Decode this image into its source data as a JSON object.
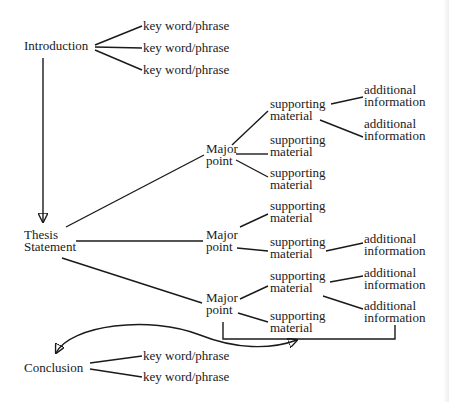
{
  "diagram": {
    "type": "essay-structure-tree",
    "nodes": {
      "introduction": {
        "label": "Introduction",
        "x": 24,
        "y": 40
      },
      "intro_kw": [
        {
          "label": "key word/phrase",
          "x": 143,
          "y": 20
        },
        {
          "label": "key word/phrase",
          "x": 143,
          "y": 42
        },
        {
          "label": "key word/phrase",
          "x": 143,
          "y": 64
        }
      ],
      "thesis": {
        "lines": [
          "Thesis",
          "Statement"
        ],
        "x": 24,
        "y": 229
      },
      "major_points": [
        {
          "lines": [
            "Major",
            "point"
          ],
          "x": 206,
          "y": 148,
          "supporting": [
            {
              "lines": [
                "supporting",
                "material"
              ],
              "x": 270,
              "y": 95,
              "additional": [
                {
                  "lines": [
                    "additional",
                    "information"
                  ],
                  "x": 364,
                  "y": 84
                },
                {
                  "lines": [
                    "additional",
                    "information"
                  ],
                  "x": 364,
                  "y": 119
                }
              ]
            },
            {
              "lines": [
                "supporting",
                "material"
              ],
              "x": 270,
              "y": 133,
              "additional": []
            },
            {
              "lines": [
                "supporting",
                "material"
              ],
              "x": 270,
              "y": 167,
              "additional": []
            }
          ]
        },
        {
          "lines": [
            "Major",
            "point"
          ],
          "x": 206,
          "y": 229,
          "supporting": [
            {
              "lines": [
                "supporting",
                "material"
              ],
              "x": 270,
              "y": 200,
              "additional": []
            },
            {
              "lines": [
                "supporting",
                "material"
              ],
              "x": 270,
              "y": 237,
              "additional": [
                {
                  "lines": [
                    "additional",
                    "information"
                  ],
                  "x": 364,
                  "y": 233
                }
              ]
            }
          ]
        },
        {
          "lines": [
            "Major",
            "point"
          ],
          "x": 206,
          "y": 296,
          "supporting": [
            {
              "lines": [
                "supporting",
                "material"
              ],
              "x": 270,
              "y": 274,
              "additional": [
                {
                  "lines": [
                    "additional",
                    "information"
                  ],
                  "x": 364,
                  "y": 267
                },
                {
                  "lines": [
                    "additional",
                    "information"
                  ],
                  "x": 364,
                  "y": 300
                }
              ]
            },
            {
              "lines": [
                "supporting",
                "material"
              ],
              "x": 270,
              "y": 313,
              "additional": []
            }
          ]
        }
      ],
      "conclusion": {
        "label": "Conclusion",
        "x": 24,
        "y": 364
      },
      "conclusion_kw": [
        {
          "label": "key word/phrase",
          "x": 143,
          "y": 351
        },
        {
          "label": "key word/phrase",
          "x": 143,
          "y": 372
        }
      ]
    },
    "labels": {
      "introduction": "Introduction",
      "kw": "key word/phrase",
      "thesis_1": "Thesis",
      "thesis_2": "Statement",
      "major_1": "Major",
      "major_2": "point",
      "supporting_1": "supporting",
      "supporting_2": "material",
      "additional_1": "additional",
      "additional_2": "information",
      "conclusion": "Conclusion"
    },
    "colors": {
      "ink": "#1a1a1a",
      "background": "#ffffff"
    }
  }
}
